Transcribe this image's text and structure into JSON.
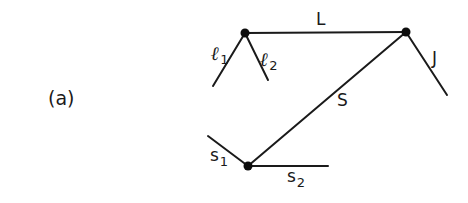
{
  "figure": {
    "panel_label": "(a)",
    "colors": {
      "ink": "#1a1a1a",
      "background": "#ffffff"
    },
    "nodes": [
      {
        "id": "left-top",
        "x": 245,
        "y": 33
      },
      {
        "id": "right-top",
        "x": 406,
        "y": 32
      },
      {
        "id": "bottom",
        "x": 248,
        "y": 166
      }
    ],
    "edges": [
      {
        "id": "L",
        "label": "L",
        "from": [
          245,
          33
        ],
        "to": [
          406,
          32
        ]
      },
      {
        "id": "S",
        "label": "S",
        "from": [
          248,
          166
        ],
        "to": [
          406,
          32
        ]
      },
      {
        "id": "J",
        "label": "J",
        "from": [
          406,
          32
        ],
        "to": [
          447,
          95
        ]
      },
      {
        "id": "l1",
        "label_main": "ℓ",
        "label_sub": "1",
        "from": [
          245,
          33
        ],
        "to": [
          213,
          86
        ]
      },
      {
        "id": "l2",
        "label_main": "ℓ",
        "label_sub": "2",
        "from": [
          245,
          33
        ],
        "to": [
          268,
          80
        ]
      },
      {
        "id": "s1",
        "label_main": "s",
        "label_sub": "1",
        "from": [
          208,
          136
        ],
        "to": [
          248,
          166
        ]
      },
      {
        "id": "s2",
        "label_main": "s",
        "label_sub": "2",
        "from": [
          248,
          166
        ],
        "to": [
          328,
          166
        ]
      }
    ]
  }
}
